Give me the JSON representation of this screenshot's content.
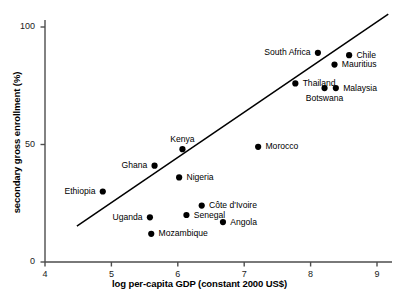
{
  "chart_data": {
    "type": "scatter",
    "title": "",
    "xlabel": "log per-capita GDP (constant 2000 US$)",
    "ylabel": "secondary gross enrollment (%)",
    "xlim": [
      4,
      9
    ],
    "ylim": [
      0,
      110
    ],
    "xticks": [
      4,
      5,
      6,
      7,
      8,
      9
    ],
    "xtick_labels": [
      "4",
      "5",
      "6",
      "7",
      "8",
      "9"
    ],
    "yticks": [
      0,
      50,
      100
    ],
    "ytick_labels": [
      "0",
      "50",
      "100"
    ],
    "grid": false,
    "legend": "none",
    "marker_color": "#000000",
    "line_color": "#000000",
    "points": [
      {
        "label": "Ethiopia",
        "x": 4.87,
        "y": 30,
        "label_pos": "left"
      },
      {
        "label": "Uganda",
        "x": 5.58,
        "y": 19,
        "label_pos": "left"
      },
      {
        "label": "Mozambique",
        "x": 5.6,
        "y": 12,
        "label_pos": "right"
      },
      {
        "label": "Ghana",
        "x": 5.65,
        "y": 41,
        "label_pos": "left"
      },
      {
        "label": "Nigeria",
        "x": 6.02,
        "y": 36,
        "label_pos": "right"
      },
      {
        "label": "Kenya",
        "x": 6.07,
        "y": 48,
        "label_pos": "above"
      },
      {
        "label": "Senegal",
        "x": 6.13,
        "y": 20,
        "label_pos": "right"
      },
      {
        "label": "Côte d'Ivoire",
        "x": 6.36,
        "y": 24,
        "label_pos": "right"
      },
      {
        "label": "Angola",
        "x": 6.68,
        "y": 17,
        "label_pos": "right"
      },
      {
        "label": "Morocco",
        "x": 7.21,
        "y": 49,
        "label_pos": "right"
      },
      {
        "label": "Thailand",
        "x": 7.77,
        "y": 76,
        "label_pos": "right"
      },
      {
        "label": "South Africa",
        "x": 8.11,
        "y": 89,
        "label_pos": "left"
      },
      {
        "label": "Botswana",
        "x": 8.21,
        "y": 74,
        "label_pos": "below"
      },
      {
        "label": "Mauritius",
        "x": 8.36,
        "y": 84,
        "label_pos": "right"
      },
      {
        "label": "Malaysia",
        "x": 8.38,
        "y": 74,
        "label_pos": "right"
      },
      {
        "label": "Chile",
        "x": 8.58,
        "y": 88,
        "label_pos": "right"
      }
    ],
    "trendline": {
      "label": "regression line",
      "x_start": 4.48,
      "y_start": 15.3,
      "x_end": 9.17,
      "y_end": 105.5
    }
  }
}
